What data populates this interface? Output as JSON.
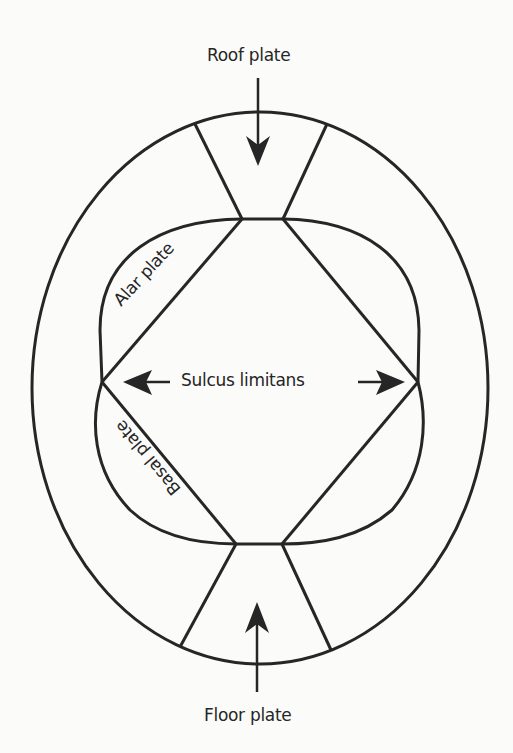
{
  "diagram": {
    "type": "neural tube cross-section",
    "colors": {
      "line": "#262626",
      "background": "#fbfbfa"
    },
    "labels": {
      "roof_plate": "Roof plate",
      "alar_plate": "Alar plate",
      "sulcus_limitans": "Sulcus limitans",
      "basal_plate": "Basal plate",
      "floor_plate": "Floor plate"
    },
    "arrows": {
      "roof": "points down to roof plate",
      "floor": "points up to floor plate",
      "sulcus_left": "points left to sulcus",
      "sulcus_right": "points right to sulcus"
    }
  }
}
